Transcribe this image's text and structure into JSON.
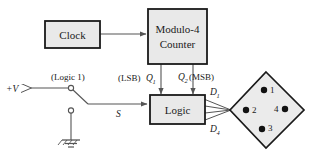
{
  "diagram": {
    "colors": {
      "box_fill": "#e9e9e9",
      "box_stroke": "#1a1a1a",
      "wire": "#555555",
      "text": "#1a1a1a",
      "diamond_fill": "#ebebeb",
      "dot_fill": "#111111",
      "background": "#ffffff"
    },
    "blocks": [
      {
        "id": "clock",
        "label": "Clock"
      },
      {
        "id": "counter",
        "label_line1": "Modulo-4",
        "label_line2": "Counter"
      },
      {
        "id": "logic",
        "label": "Logic"
      }
    ],
    "signals": {
      "q1_prefix": "(LSB)",
      "q1_symbol": "Q",
      "q1_subscript": "1",
      "q2_symbol": "Q",
      "q2_subscript": "2",
      "q2_suffix": "(MSB)",
      "d1_symbol": "D",
      "d1_subscript": "1",
      "d4_symbol": "D",
      "d4_subscript": "4",
      "switch_signal": "S"
    },
    "supply": {
      "label": "+V",
      "logic_level": "(Logic 1)"
    },
    "display": {
      "name": "led-diamond",
      "leds": [
        {
          "number": "1",
          "position": "top"
        },
        {
          "number": "2",
          "position": "left"
        },
        {
          "number": "4",
          "position": "right"
        },
        {
          "number": "3",
          "position": "bottom"
        }
      ]
    }
  }
}
